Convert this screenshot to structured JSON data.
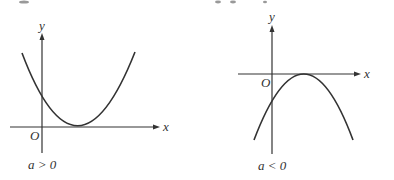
{
  "figures": [
    {
      "id": "left",
      "caption": "a > 0",
      "axis_labels": {
        "x": "x",
        "y": "y",
        "origin": "O"
      },
      "parabola": {
        "opens": "up",
        "vertex_position": "on positive x-axis (tangent)",
        "y_intercept": "positive"
      }
    },
    {
      "id": "right",
      "caption": "a < 0",
      "axis_labels": {
        "x": "x",
        "y": "y",
        "origin": "O"
      },
      "parabola": {
        "opens": "down",
        "vertex_position": "on positive x-axis (tangent)",
        "y_intercept": "negative"
      }
    }
  ]
}
